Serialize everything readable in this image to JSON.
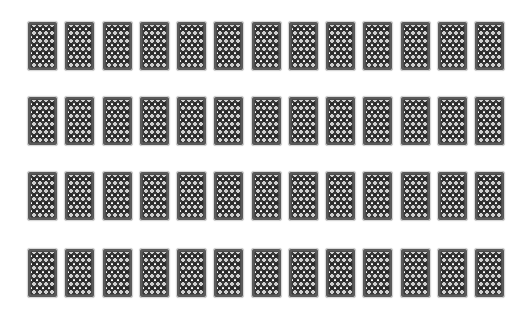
{
  "game": {
    "type": "memory-card-grid",
    "rows": 4,
    "columns": 13,
    "total_cards": 52,
    "card_state": "face-down",
    "card_back_colors": {
      "border": "#5a5a5a",
      "field": "#cfcfcf",
      "pattern": "#2b2b2b",
      "highlight": "#ffffff"
    },
    "layout": {
      "origin_x": 27,
      "row_tops": [
        21,
        96,
        171,
        248
      ],
      "column_pitch": 37.25,
      "card_width": 31,
      "card_height": 50
    }
  }
}
